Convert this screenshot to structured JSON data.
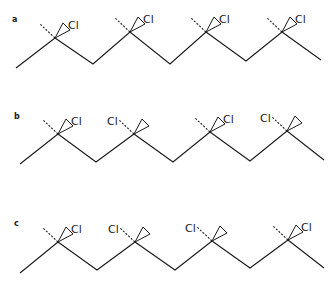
{
  "figure": {
    "atom_label": "Cl",
    "colors": {
      "stroke": "#1a1a1a",
      "background": "#ffffff"
    },
    "panels": [
      {
        "label": "a",
        "configuration": "isotactic",
        "label_pos": [
          12,
          22
        ],
        "backbone": [
          [
            16,
            68
          ],
          [
            55,
            38
          ],
          [
            93,
            64
          ],
          [
            130,
            32
          ],
          [
            170,
            64
          ],
          [
            206,
            32
          ],
          [
            246,
            61
          ],
          [
            282,
            32
          ],
          [
            321,
            60
          ]
        ],
        "substituents": [
          {
            "center": [
              55,
              38
            ],
            "cl": "wedge"
          },
          {
            "center": [
              130,
              32
            ],
            "cl": "wedge"
          },
          {
            "center": [
              206,
              32
            ],
            "cl": "wedge"
          },
          {
            "center": [
              282,
              32
            ],
            "cl": "wedge"
          }
        ]
      },
      {
        "label": "b",
        "configuration": "syndiotactic",
        "label_pos": [
          14,
          119
        ],
        "backbone": [
          [
            20,
            164
          ],
          [
            58,
            134
          ],
          [
            96,
            162
          ],
          [
            134,
            134
          ],
          [
            173,
            162
          ],
          [
            210,
            132
          ],
          [
            250,
            161
          ],
          [
            287,
            131
          ],
          [
            324,
            160
          ]
        ],
        "substituents": [
          {
            "center": [
              58,
              134
            ],
            "cl": "wedge"
          },
          {
            "center": [
              134,
              134
            ],
            "cl": "hash"
          },
          {
            "center": [
              210,
              132
            ],
            "cl": "wedge"
          },
          {
            "center": [
              287,
              131
            ],
            "cl": "hash"
          }
        ]
      },
      {
        "label": "c",
        "configuration": "atactic",
        "label_pos": [
          14,
          226
        ],
        "backbone": [
          [
            20,
            273
          ],
          [
            58,
            242
          ],
          [
            97,
            270
          ],
          [
            135,
            242
          ],
          [
            175,
            270
          ],
          [
            212,
            241
          ],
          [
            250,
            268
          ],
          [
            288,
            240
          ],
          [
            324,
            268
          ]
        ],
        "substituents": [
          {
            "center": [
              58,
              242
            ],
            "cl": "wedge"
          },
          {
            "center": [
              135,
              242
            ],
            "cl": "hash"
          },
          {
            "center": [
              212,
              241
            ],
            "cl": "hash"
          },
          {
            "center": [
              288,
              240
            ],
            "cl": "wedge"
          }
        ]
      }
    ]
  }
}
